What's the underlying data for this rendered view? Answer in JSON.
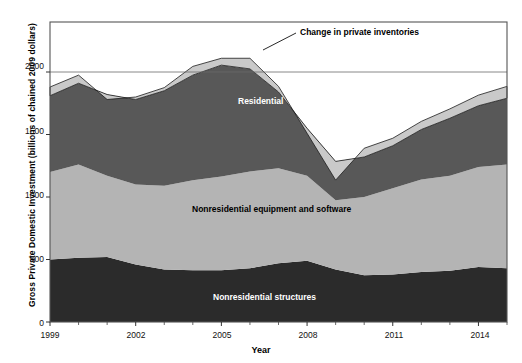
{
  "chart_data": {
    "type": "area",
    "title": "",
    "subtitle": "",
    "xlabel": "Year",
    "ylabel": "Gross Private Domestic Investment (billions of chained 2009 dollars)",
    "xlim": [
      1999,
      2015
    ],
    "ylim": [
      0,
      2400
    ],
    "yticks": [
      0,
      500,
      1000,
      1500,
      2000
    ],
    "ytick_labels": [
      "0",
      "500",
      "1000",
      "1500",
      "2000"
    ],
    "xticks": [
      1999,
      2002,
      2005,
      2008,
      2011,
      2014
    ],
    "xtick_labels": [
      "1999",
      "2002",
      "2005",
      "2008",
      "2011",
      "2014"
    ],
    "xminorticks": [
      2000,
      2001,
      2003,
      2004,
      2006,
      2007,
      2009,
      2010,
      2012,
      2013,
      2015
    ],
    "grid": false,
    "gridline_at": 2000,
    "stacked": true,
    "legend_position": "inline-labels",
    "x": [
      1999,
      2000,
      2001,
      2002,
      2003,
      2004,
      2005,
      2006,
      2007,
      2008,
      2009,
      2010,
      2011,
      2012,
      2013,
      2014,
      2015
    ],
    "series": [
      {
        "name": "Nonresidential structures",
        "color": "#2b2b2b",
        "label_color": "#ffffff",
        "values": [
          500,
          515,
          520,
          460,
          420,
          415,
          415,
          430,
          470,
          490,
          420,
          375,
          380,
          400,
          410,
          440,
          430
        ]
      },
      {
        "name": "Nonresidential equipment and software",
        "color": "#b4b4b4",
        "label_color": "#000000",
        "values": [
          700,
          745,
          650,
          640,
          670,
          720,
          750,
          775,
          760,
          680,
          555,
          625,
          690,
          740,
          760,
          800,
          830
        ]
      },
      {
        "name": "Residential",
        "color": "#585858",
        "label_color": "#ffffff",
        "values": [
          610,
          650,
          650,
          680,
          760,
          840,
          890,
          820,
          610,
          380,
          310,
          320,
          340,
          400,
          460,
          490,
          530
        ]
      },
      {
        "name": "Change in private inventories",
        "color": "#c9c9c9",
        "label_color": "#000000",
        "values": [
          70,
          65,
          -40,
          20,
          25,
          70,
          55,
          85,
          45,
          -40,
          -150,
          70,
          60,
          65,
          75,
          85,
          95
        ]
      }
    ],
    "annotations": [
      {
        "text": "Change in private inventories",
        "x_px": 300,
        "y_px": 33,
        "leader_from_x_px": 263,
        "leader_from_y_px": 50,
        "leader_to_x_px": 296,
        "leader_to_y_px": 33
      }
    ],
    "inline_labels": [
      {
        "text": "Residential",
        "x_px": 238,
        "y_px": 96,
        "color": "#ffffff"
      },
      {
        "text": "Nonresidential equipment and software",
        "x_px": 192,
        "y_px": 204,
        "color": "#000000"
      },
      {
        "text": "Nonresidential structures",
        "x_px": 213,
        "y_px": 292,
        "color": "#ffffff"
      }
    ]
  },
  "axes": {
    "y_title": "Gross Private Domestic Investment (billions of chained 2009 dollars)",
    "x_title": "Year"
  },
  "colors": {
    "structures": "#2b2b2b",
    "equipment": "#b4b4b4",
    "residential": "#585858",
    "inventories": "#c9c9c9",
    "frame": "#555555",
    "background": "#ffffff"
  }
}
